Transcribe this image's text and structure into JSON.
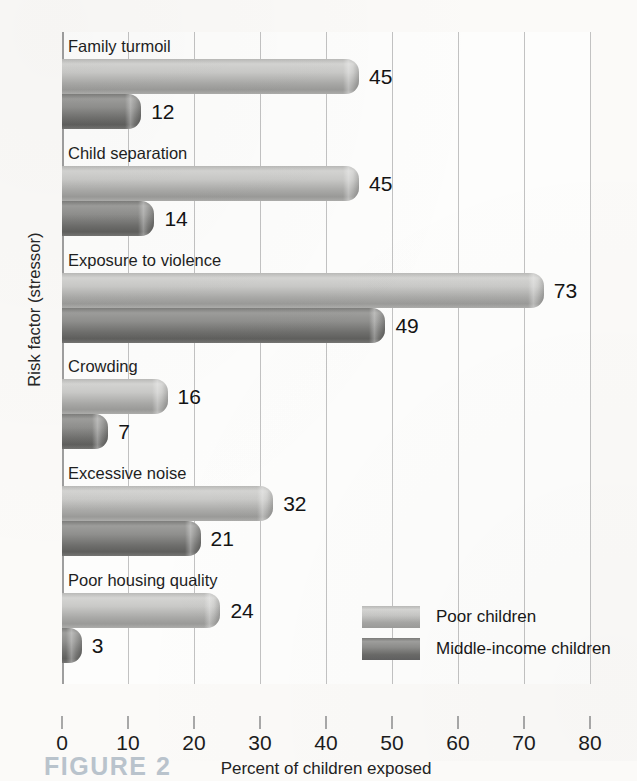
{
  "chart_data": {
    "type": "bar",
    "orientation": "horizontal",
    "title": "",
    "xlabel": "Percent of children exposed",
    "ylabel": "Risk factor (stressor)",
    "xlim": [
      0,
      80
    ],
    "xticks": [
      "0",
      "10",
      "20",
      "30",
      "40",
      "50",
      "60",
      "70",
      "80"
    ],
    "grid": true,
    "legend_position": "inside-bottom-right",
    "categories": [
      "Family turmoil",
      "Child separation",
      "Exposure to violence",
      "Crowding",
      "Excessive noise",
      "Poor housing quality"
    ],
    "series": [
      {
        "name": "Poor children",
        "color": "#c3c3c1",
        "values": [
          45,
          45,
          73,
          16,
          32,
          24
        ]
      },
      {
        "name": "Middle-income children",
        "color": "#808080",
        "values": [
          12,
          14,
          49,
          7,
          21,
          3
        ]
      }
    ]
  },
  "axis": {
    "x_title": "Percent of children exposed",
    "y_title": "Risk factor (stressor)",
    "ticks": [
      "0",
      "10",
      "20",
      "30",
      "40",
      "50",
      "60",
      "70",
      "80"
    ]
  },
  "legend": {
    "items": [
      {
        "label": "Poor children"
      },
      {
        "label": "Middle-income children"
      }
    ]
  },
  "groups": [
    {
      "label": "Family turmoil",
      "poor": {
        "value": 45,
        "text": "45"
      },
      "mid": {
        "value": 12,
        "text": "12"
      }
    },
    {
      "label": "Child separation",
      "poor": {
        "value": 45,
        "text": "45"
      },
      "mid": {
        "value": 14,
        "text": "14"
      }
    },
    {
      "label": "Exposure to violence",
      "poor": {
        "value": 73,
        "text": "73"
      },
      "mid": {
        "value": 49,
        "text": "49"
      }
    },
    {
      "label": "Crowding",
      "poor": {
        "value": 16,
        "text": "16"
      },
      "mid": {
        "value": 7,
        "text": "7"
      }
    },
    {
      "label": "Excessive noise",
      "poor": {
        "value": 32,
        "text": "32"
      },
      "mid": {
        "value": 21,
        "text": "21"
      }
    },
    {
      "label": "Poor housing quality",
      "poor": {
        "value": 24,
        "text": "24"
      },
      "mid": {
        "value": 3,
        "text": "3"
      }
    }
  ],
  "caption": {
    "text": "FIGURE 2"
  }
}
